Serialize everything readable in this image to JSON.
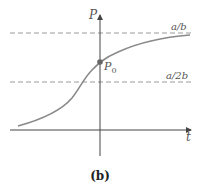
{
  "diagram": {
    "type": "logistic-growth-curve",
    "axes": {
      "y_label": "P",
      "x_label": "t"
    },
    "asymptotes": [
      {
        "label": "a/b",
        "level": "upper"
      },
      {
        "label": "a/2b",
        "level": "inflection"
      }
    ],
    "point": {
      "label": "P",
      "subscript": "0"
    },
    "caption": "(b)",
    "colors": {
      "curve": "#8a8a8a",
      "axis": "#444444",
      "dashed": "#9a9a9a",
      "point": "#666666"
    }
  }
}
